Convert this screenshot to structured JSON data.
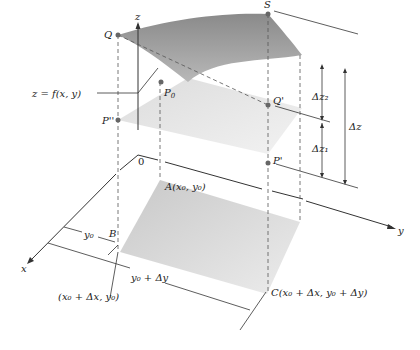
{
  "diagram": {
    "type": "3d-increment-diagram",
    "axes": {
      "x": "x",
      "y": "y",
      "z": "z",
      "origin": "0"
    },
    "points": {
      "Q": "Q",
      "S": "S",
      "P0": "P",
      "P0_sub": "0",
      "P_double_prime": "P''",
      "Q_prime": "Q'",
      "P_prime": "P'",
      "B": "B"
    },
    "labels": {
      "surface": "z = f(x, y)",
      "A": "A(x",
      "A_full": "A(x₀, y₀)",
      "B_coord": "(x₀ + Δx, y₀)",
      "C_coord": "C(x₀ + Δx, y₀ + Δy)",
      "y0": "y₀",
      "y0_dy": "y₀ + Δy",
      "dz": "Δz",
      "dz1": "Δz₁",
      "dz2": "Δz₂"
    },
    "colors": {
      "surface_dark": "#7f7f7f",
      "surface_light": "#b5b5b5",
      "plane": "#e3e3e3",
      "base": "#d0d0d0",
      "line": "#333333",
      "dash": "#555555",
      "point": "#666666"
    }
  }
}
